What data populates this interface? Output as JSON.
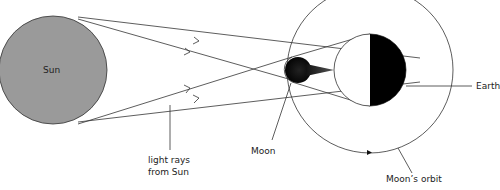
{
  "diagram": {
    "type": "lunar-eclipse-geometry",
    "labels": {
      "sun": "Sun",
      "earth": "Earth",
      "moon": "Moon",
      "light_rays_line1": "light rays",
      "light_rays_line2": "from Sun",
      "moon_orbit": "Moon’s orbit"
    },
    "colors": {
      "sun_fill": "#9a9a9a",
      "stroke": "#333333",
      "shadow": "#111111",
      "background": "#ffffff"
    }
  }
}
